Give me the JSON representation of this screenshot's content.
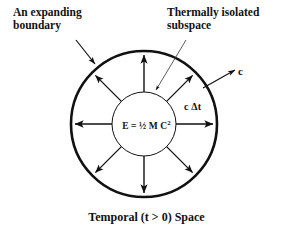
{
  "diagram": {
    "background_color": "#ffffff",
    "stroke_color": "#111111",
    "labels": {
      "expanding_boundary": "An expanding\nboundary",
      "thermally_isolated": "Thermally isolated\nsubspace",
      "speed_of_light": "c",
      "distance_traveled": "c Δt",
      "energy_equation": "E = ½ M C",
      "energy_equation_exponent": "2",
      "caption": "Temporal (t > 0) Space"
    },
    "geometry": {
      "center_x": 144,
      "center_y": 124,
      "outer_radius": 73,
      "inner_radius": 32,
      "outer_stroke_width": 2.6,
      "inner_stroke_width": 1.0,
      "spoke_stroke_width": 1.3,
      "spoke_count": 8,
      "spoke_angles_deg": [
        90,
        45,
        0,
        315,
        270,
        225,
        180,
        135
      ]
    },
    "leaders": {
      "expanding_boundary": {
        "x1": 76,
        "y1": 40,
        "x2": 95,
        "y2": 64
      },
      "thermally_isolated": {
        "x1": 186,
        "y1": 40,
        "x2": 156,
        "y2": 90
      },
      "speed_of_light": {
        "x1": 203,
        "y1": 88,
        "x2": 235,
        "y2": 70
      }
    }
  }
}
